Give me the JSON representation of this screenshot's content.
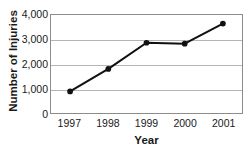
{
  "chart_data": {
    "type": "line",
    "title": "",
    "xlabel": "Year",
    "ylabel": "Number of Injuries",
    "categories": [
      "1997",
      "1998",
      "1999",
      "2000",
      "2001"
    ],
    "values": [
      880,
      1800,
      2870,
      2830,
      3650
    ],
    "series": [
      {
        "name": "Number of Injuries",
        "values": [
          880,
          1800,
          2870,
          2830,
          3650
        ]
      }
    ],
    "ylim": [
      0,
      4000
    ],
    "ytick_labels": [
      "0",
      "1,000",
      "2,000",
      "3,000",
      "4,000"
    ],
    "ytick_values": [
      0,
      1000,
      2000,
      3000,
      4000
    ],
    "xtick_labels": [
      "1997",
      "1998",
      "1999",
      "2000",
      "2001"
    ],
    "grid": "horizontal",
    "legend": "none",
    "marker": "filled-circle",
    "colors": {
      "line": "#111111",
      "marker": "#111111",
      "gridline": "#b5b5b5",
      "frame": "#8c8c8c",
      "text": "#1a1a1a",
      "background": "#ffffff"
    }
  }
}
